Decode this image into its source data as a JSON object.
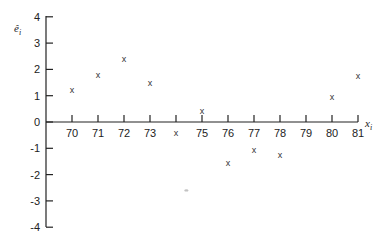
{
  "chart_data": {
    "type": "scatter",
    "title": "",
    "xlabel": "x_i",
    "ylabel": "ê_i",
    "xlim": [
      69,
      81
    ],
    "ylim": [
      -4,
      4
    ],
    "x_ticks": [
      70,
      71,
      72,
      73,
      74,
      75,
      76,
      77,
      78,
      79,
      80,
      81
    ],
    "x_tick_labels": [
      "70",
      "71",
      "72",
      "73",
      "",
      "75",
      "76",
      "77",
      "78",
      "79",
      "80",
      "81"
    ],
    "y_ticks": [
      -4,
      -3,
      -2,
      -1,
      0,
      1,
      2,
      3,
      4
    ],
    "y_tick_labels": [
      "-4",
      "-3",
      "-2",
      "-1",
      "0",
      "1",
      "2",
      "3",
      "4"
    ],
    "grid": false,
    "marker": "x",
    "series": [
      {
        "name": "residuals",
        "x": [
          70,
          71,
          72,
          73,
          74,
          75,
          76,
          77,
          78,
          80,
          81
        ],
        "y": [
          1.2,
          1.8,
          2.4,
          1.5,
          -0.4,
          0.4,
          -1.55,
          -1.05,
          -1.25,
          0.95,
          1.75
        ]
      }
    ],
    "annotations": [
      {
        "x": 74.4,
        "y": -2.6,
        "text": "faint mark"
      }
    ]
  },
  "labels": {
    "y_axis": "ê",
    "y_axis_sub": "i",
    "x_axis": "x",
    "x_axis_sub": "i"
  }
}
